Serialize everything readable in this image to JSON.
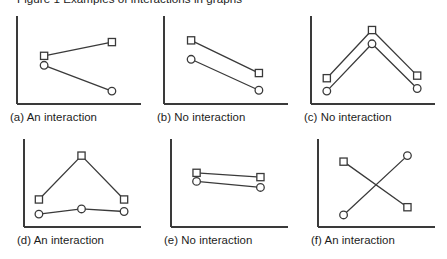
{
  "figure": {
    "title_cropped": "Figure 1  Examples of interactions in graphs",
    "background_color": "#ffffff",
    "axis_color": "#3a3a3a",
    "line_color": "#3a3a3a",
    "marker_fill": "#ffffff",
    "marker_stroke": "#3a3a3a",
    "caption_color": "#1b1b1b"
  },
  "chart_data": [
    {
      "id": "a",
      "type": "line",
      "title": "(a) An interaction",
      "caption_label": "(a) An interaction",
      "xlabel": "",
      "ylabel": "",
      "x": [
        1,
        2
      ],
      "xlim": [
        0.6,
        2.4
      ],
      "ylim": [
        0,
        10
      ],
      "grid": false,
      "legend": "none",
      "axes": [
        "left",
        "bottom"
      ],
      "series": [
        {
          "name": "square",
          "marker": "square",
          "values": [
            5.6,
            7.2
          ]
        },
        {
          "name": "circle",
          "marker": "circle",
          "values": [
            4.5,
            1.5
          ]
        }
      ]
    },
    {
      "id": "b",
      "type": "line",
      "title": "(b) No interaction",
      "caption_label": "(b) No interaction",
      "xlabel": "",
      "ylabel": "",
      "x": [
        1,
        2
      ],
      "xlim": [
        0.6,
        2.4
      ],
      "ylim": [
        0,
        10
      ],
      "grid": false,
      "legend": "none",
      "axes": [
        "left",
        "bottom"
      ],
      "series": [
        {
          "name": "square",
          "marker": "square",
          "values": [
            7.4,
            3.6
          ]
        },
        {
          "name": "circle",
          "marker": "circle",
          "values": [
            5.2,
            1.6
          ]
        }
      ]
    },
    {
      "id": "c",
      "type": "line",
      "title": "(c) No interaction",
      "caption_label": "(c) No interaction",
      "xlabel": "",
      "ylabel": "",
      "x": [
        1,
        2,
        3
      ],
      "xlim": [
        0.65,
        3.35
      ],
      "ylim": [
        0,
        10
      ],
      "grid": false,
      "legend": "none",
      "axes": [
        "left",
        "bottom"
      ],
      "series": [
        {
          "name": "square",
          "marker": "square",
          "values": [
            3.0,
            8.6,
            3.3
          ]
        },
        {
          "name": "circle",
          "marker": "circle",
          "values": [
            1.5,
            7.0,
            1.8
          ]
        }
      ]
    },
    {
      "id": "d",
      "type": "line",
      "title": "(d) An interaction",
      "caption_label": "(d) An interaction",
      "xlabel": "",
      "ylabel": "",
      "x": [
        1,
        2,
        3
      ],
      "xlim": [
        0.65,
        3.35
      ],
      "ylim": [
        0,
        10
      ],
      "grid": false,
      "legend": "none",
      "axes": [
        "left",
        "bottom"
      ],
      "series": [
        {
          "name": "square",
          "marker": "square",
          "values": [
            3.2,
            8.3,
            3.2
          ]
        },
        {
          "name": "circle",
          "marker": "circle",
          "values": [
            1.5,
            2.1,
            1.8
          ]
        }
      ]
    },
    {
      "id": "e",
      "type": "line",
      "title": "(e) No interaction",
      "caption_label": "(e) No interaction",
      "xlabel": "",
      "ylabel": "",
      "x": [
        1,
        2
      ],
      "xlim": [
        0.6,
        2.4
      ],
      "ylim": [
        0,
        10
      ],
      "grid": false,
      "legend": "none",
      "axes": [
        "left",
        "bottom"
      ],
      "series": [
        {
          "name": "square",
          "marker": "square",
          "values": [
            6.3,
            5.8
          ]
        },
        {
          "name": "circle",
          "marker": "circle",
          "values": [
            5.3,
            4.6
          ]
        }
      ]
    },
    {
      "id": "f",
      "type": "line",
      "title": "(f) An interaction",
      "caption_label": "(f) An interaction",
      "xlabel": "",
      "ylabel": "",
      "x": [
        1,
        2
      ],
      "xlim": [
        0.6,
        2.4
      ],
      "ylim": [
        0,
        10
      ],
      "grid": false,
      "legend": "none",
      "axes": [
        "left",
        "bottom"
      ],
      "series": [
        {
          "name": "square",
          "marker": "square",
          "values": [
            7.6,
            2.3
          ]
        },
        {
          "name": "circle",
          "marker": "circle",
          "values": [
            1.4,
            8.3
          ]
        }
      ]
    }
  ],
  "panels": [
    {
      "id": "a",
      "caption": "(a) An interaction"
    },
    {
      "id": "b",
      "caption": "(b) No interaction"
    },
    {
      "id": "c",
      "caption": "(c) No interaction"
    },
    {
      "id": "d",
      "caption": "(d) An interaction"
    },
    {
      "id": "e",
      "caption": "(e) No interaction"
    },
    {
      "id": "f",
      "caption": "(f) An interaction"
    }
  ]
}
